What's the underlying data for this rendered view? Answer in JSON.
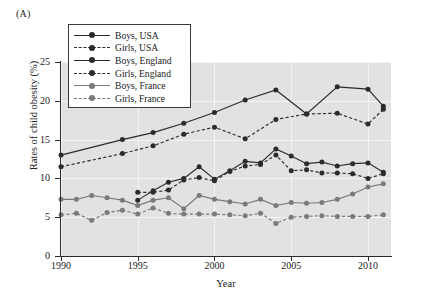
{
  "figure": {
    "panel_label": "(A)",
    "xlabel": "Year",
    "ylabel": "Rates of child obesity (%)"
  },
  "axes": {
    "y_ticks": [
      "0",
      "5",
      "10",
      "15",
      "20",
      "25"
    ],
    "x_ticks": [
      "1990",
      "1995",
      "2000",
      "2005",
      "2010"
    ]
  },
  "legend": {
    "items": [
      {
        "label": "Boys, USA",
        "color": "#2b2b2b",
        "dash": "solid",
        "marker": "circle"
      },
      {
        "label": "Girls, USA",
        "color": "#2b2b2b",
        "dash": "dashed",
        "marker": "circle"
      },
      {
        "label": "Boys, England",
        "color": "#2b2b2b",
        "dash": "solid",
        "marker": "circle"
      },
      {
        "label": "Girls, England",
        "color": "#2b2b2b",
        "dash": "dashed",
        "marker": "circle"
      },
      {
        "label": "Boys, France",
        "color": "#7a7a7a",
        "dash": "solid",
        "marker": "circle"
      },
      {
        "label": "Girls, France",
        "color": "#7a7a7a",
        "dash": "dashed",
        "marker": "circle"
      }
    ]
  },
  "chart_data": {
    "type": "line",
    "title": "",
    "subtitle": "",
    "xlabel": "Year",
    "ylabel": "Rates of child obesity (%)",
    "xlim": [
      1990,
      2011.5
    ],
    "ylim": [
      0,
      25
    ],
    "yticks": [
      0,
      5,
      10,
      15,
      20,
      25
    ],
    "xticks": [
      1990,
      1995,
      2000,
      2005,
      2010
    ],
    "grid": true,
    "grid_color": "#f4f4f4",
    "plot_background": "#e2e2e2",
    "legend_position": "upper-left-inside",
    "series": [
      {
        "name": "Boys, USA",
        "color": "#2b2b2b",
        "dash": "solid",
        "x": [
          1990,
          1994,
          1996,
          1998,
          2000,
          2002,
          2004,
          2006,
          2008,
          2010,
          2011
        ],
        "values": [
          13.0,
          15.0,
          15.9,
          17.1,
          18.5,
          20.1,
          21.4,
          18.3,
          21.8,
          21.5,
          19.3
        ]
      },
      {
        "name": "Girls, USA",
        "color": "#2b2b2b",
        "dash": "dashed",
        "x": [
          1990,
          1994,
          1996,
          1998,
          2000,
          2002,
          2004,
          2006,
          2008,
          2010,
          2011
        ],
        "values": [
          11.5,
          13.2,
          14.2,
          15.7,
          16.6,
          15.1,
          17.6,
          18.3,
          18.4,
          17.0,
          18.9
        ]
      },
      {
        "name": "Boys, England",
        "color": "#2b2b2b",
        "dash": "solid",
        "x": [
          1995,
          1996,
          1997,
          1998,
          1999,
          2000,
          2001,
          2002,
          2003,
          2004,
          2005,
          2006,
          2007,
          2008,
          2009,
          2010,
          2011
        ],
        "values": [
          7.2,
          8.4,
          9.5,
          10.0,
          11.5,
          9.9,
          11.0,
          12.2,
          12.0,
          13.8,
          12.9,
          11.9,
          12.1,
          11.6,
          11.9,
          12.0,
          10.8
        ]
      },
      {
        "name": "Girls, England",
        "color": "#2b2b2b",
        "dash": "dashed",
        "x": [
          1995,
          1996,
          1997,
          1998,
          1999,
          2000,
          2001,
          2002,
          2003,
          2004,
          2005,
          2006,
          2007,
          2008,
          2009,
          2010,
          2011
        ],
        "values": [
          8.2,
          8.2,
          8.5,
          9.8,
          10.1,
          9.7,
          10.9,
          11.6,
          11.8,
          13.0,
          11.0,
          11.1,
          10.7,
          10.7,
          10.6,
          10.0,
          10.6
        ]
      },
      {
        "name": "Boys, France",
        "color": "#7a7a7a",
        "dash": "solid",
        "x": [
          1990,
          1991,
          1992,
          1993,
          1994,
          1995,
          1996,
          1997,
          1998,
          1999,
          2000,
          2001,
          2002,
          2003,
          2004,
          2005,
          2006,
          2007,
          2008,
          2009,
          2010,
          2011
        ],
        "values": [
          7.3,
          7.3,
          7.8,
          7.5,
          7.2,
          6.5,
          7.2,
          7.5,
          6.1,
          7.8,
          7.3,
          7.0,
          6.7,
          7.3,
          6.5,
          6.9,
          6.8,
          6.9,
          7.3,
          8.0,
          8.9,
          9.3
        ]
      },
      {
        "name": "Girls, France",
        "color": "#7a7a7a",
        "dash": "dashed",
        "x": [
          1990,
          1991,
          1992,
          1993,
          1994,
          1995,
          1996,
          1997,
          1998,
          1999,
          2000,
          2001,
          2002,
          2003,
          2004,
          2005,
          2006,
          2007,
          2008,
          2009,
          2010,
          2011
        ],
        "values": [
          5.3,
          5.5,
          4.6,
          5.6,
          5.9,
          5.4,
          6.2,
          5.5,
          5.4,
          5.4,
          5.4,
          5.3,
          5.2,
          5.5,
          4.2,
          5.0,
          5.1,
          5.2,
          5.1,
          5.1,
          5.1,
          5.3
        ]
      }
    ]
  }
}
